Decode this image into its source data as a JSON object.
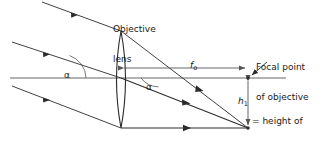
{
  "figure": {
    "background": "#ffffff",
    "stroke_color": "#2b2b2b",
    "axis_color": "#4a4a4a",
    "width": 332,
    "height": 143
  },
  "labels": {
    "objective_lens_line1": "Objective",
    "objective_lens_line2": "lens",
    "focal_point_line1": "Focal point",
    "focal_point_line2": "of objective",
    "focal_length_symbol": "f",
    "focal_length_subscript": "o",
    "image_height_symbol": "h",
    "image_height_subscript": "1",
    "image_height_text_line1": "= height of",
    "image_height_text_line2": "intermediate",
    "image_height_text_line3": "image",
    "angle_upper": "α",
    "angle_lower": "α"
  },
  "geometry": {
    "optical_axis": {
      "x1": 10,
      "y1": 78,
      "x2": 286,
      "y2": 78
    },
    "lens": {
      "center_x": 121,
      "top_y": 31,
      "bottom_y": 128,
      "bulge": 9
    },
    "focal_point": {
      "x": 248,
      "y": 78
    },
    "image_point": {
      "x": 248,
      "y": 128
    },
    "incoming_rays": [
      {
        "name": "upper-ray",
        "x1": 42,
        "y1": 2,
        "x2": 121,
        "y2": 31
      },
      {
        "name": "middle-ray",
        "x1": 12,
        "y1": 42,
        "x2": 121,
        "y2": 78
      },
      {
        "name": "lower-ray",
        "x1": 12,
        "y1": 86,
        "x2": 121,
        "y2": 128
      }
    ],
    "refracted_rays": [
      {
        "name": "upper-refracted-ray",
        "x1": 121,
        "y1": 31,
        "x2": 248,
        "y2": 128
      },
      {
        "name": "middle-refracted-ray",
        "x1": 121,
        "y1": 78,
        "x2": 248,
        "y2": 128
      },
      {
        "name": "lower-refracted-ray",
        "x1": 121,
        "y1": 128,
        "x2": 248,
        "y2": 128
      }
    ],
    "focal_length_arrow": {
      "x1": 121,
      "y1": 68,
      "x2": 248,
      "y2": 68
    },
    "image_height_arrow": {
      "x1": 248,
      "y1": 78,
      "x2": 248,
      "y2": 128
    },
    "pointer_arrow": {
      "x1": 266,
      "y1": 63,
      "x2": 250,
      "y2": 76
    }
  }
}
